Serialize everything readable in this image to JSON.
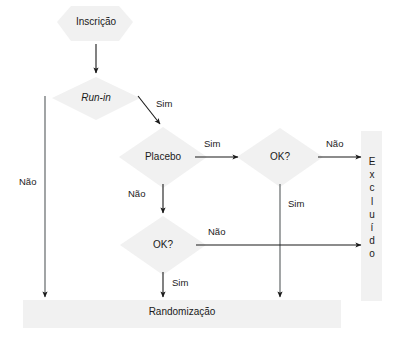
{
  "diagram": {
    "title_visible": false,
    "colors": {
      "shape_fill": "#f0f0f0",
      "shape_fill_light": "#f3f3f3",
      "line": "#1a1a1a",
      "text": "#1a1a1a",
      "background": "#ffffff"
    },
    "nodes": [
      {
        "id": "inscricao",
        "label": "Inscrição",
        "shape": "hexagon",
        "x": 95,
        "y": 22
      },
      {
        "id": "runin",
        "label": "Run-in",
        "shape": "diamond",
        "x": 96,
        "y": 98,
        "italic": true
      },
      {
        "id": "placebo",
        "label": "Placebo",
        "shape": "diamond",
        "x": 163,
        "y": 157
      },
      {
        "id": "ok_top",
        "label": "OK?",
        "shape": "diamond",
        "x": 280,
        "y": 157
      },
      {
        "id": "ok_bottom",
        "label": "OK?",
        "shape": "diamond",
        "x": 163,
        "y": 245
      },
      {
        "id": "excluido",
        "label": "Excluído",
        "shape": "vbar",
        "x": 371,
        "y": 215,
        "letters": [
          "E",
          "x",
          "c",
          "l",
          "u",
          "í",
          "d",
          "o"
        ]
      },
      {
        "id": "randomizacao",
        "label": "Randomização",
        "shape": "bar",
        "x": 185,
        "y": 312
      }
    ],
    "edges": [
      {
        "id": "inscricao-runin",
        "from": "inscricao",
        "to": "runin",
        "label": "",
        "kind": "vertical"
      },
      {
        "id": "runin-randomizacao",
        "from": "runin",
        "to": "randomizacao",
        "label": "Não",
        "kind": "vertical-left"
      },
      {
        "id": "runin-placebo",
        "from": "runin",
        "to": "placebo",
        "label": "Sim",
        "kind": "diagonal"
      },
      {
        "id": "placebo-oktop",
        "from": "placebo",
        "to": "ok_top",
        "label": "Sim",
        "kind": "horizontal"
      },
      {
        "id": "placebo-okbottom",
        "from": "placebo",
        "to": "ok_bottom",
        "label": "Não",
        "kind": "vertical"
      },
      {
        "id": "oktop-excluido",
        "from": "ok_top",
        "to": "excluido",
        "label": "Não",
        "kind": "horizontal"
      },
      {
        "id": "oktop-randomizacao",
        "from": "ok_top",
        "to": "randomizacao",
        "label": "Sim",
        "kind": "vertical"
      },
      {
        "id": "okbottom-excluido",
        "from": "ok_bottom",
        "to": "excluido",
        "label": "Não",
        "kind": "horizontal"
      },
      {
        "id": "okbottom-randomizacao",
        "from": "ok_bottom",
        "to": "randomizacao",
        "label": "Sim",
        "kind": "vertical"
      }
    ],
    "edge_labels": {
      "runin_nao": "Não",
      "runin_sim": "Sim",
      "placebo_sim": "Sim",
      "placebo_nao": "Não",
      "oktop_nao": "Não",
      "oktop_sim": "Sim",
      "okbottom_nao": "Não",
      "okbottom_sim": "Sim"
    },
    "node_labels": {
      "inscricao": "Inscrição",
      "runin": "Run-in",
      "placebo": "Placebo",
      "ok_top": "OK?",
      "ok_bottom": "OK?",
      "randomizacao": "Randomização"
    },
    "excluido_letters": {
      "l1": "E",
      "l2": "x",
      "l3": "c",
      "l4": "l",
      "l5": "u",
      "l6": "í",
      "l7": "d",
      "l8": "o"
    }
  }
}
